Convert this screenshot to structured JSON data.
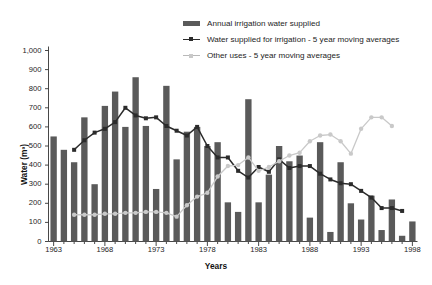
{
  "chart_data": {
    "type": "bar",
    "title": "",
    "xlabel": "Years",
    "ylabel": "Water (m³)",
    "ylim": [
      0,
      1000
    ],
    "ytick_values": [
      0,
      100,
      200,
      300,
      400,
      500,
      600,
      700,
      800,
      900,
      1000
    ],
    "ytick_labels": [
      "0",
      "100",
      "200",
      "300",
      "400",
      "500",
      "600",
      "700",
      "800",
      "900",
      "1,000"
    ],
    "xlim": [
      1963,
      1998
    ],
    "xtick_values": [
      1963,
      1968,
      1973,
      1978,
      1983,
      1988,
      1993,
      1998
    ],
    "xtick_labels": [
      "1963",
      "1968",
      "1973",
      "1978",
      "1983",
      "1988",
      "1993",
      "1998"
    ],
    "grid": false,
    "legend_position": "top-center",
    "categories": [
      1963,
      1964,
      1965,
      1966,
      1967,
      1968,
      1969,
      1970,
      1971,
      1972,
      1973,
      1974,
      1975,
      1976,
      1977,
      1978,
      1979,
      1980,
      1981,
      1982,
      1983,
      1984,
      1985,
      1986,
      1987,
      1988,
      1989,
      1990,
      1991,
      1992,
      1993,
      1994,
      1995,
      1996,
      1997,
      1998
    ],
    "series": [
      {
        "name": "Annual irrigation water supplied",
        "type": "bar",
        "color": "#5a5a5a",
        "values": [
          550,
          480,
          415,
          650,
          300,
          710,
          785,
          600,
          860,
          605,
          275,
          815,
          430,
          575,
          600,
          500,
          520,
          205,
          155,
          745,
          205,
          350,
          500,
          420,
          450,
          125,
          520,
          50,
          415,
          200,
          115,
          240,
          60,
          220,
          30,
          105
        ]
      },
      {
        "name": "Water supplied for irrigation - 5 year moving averages",
        "type": "line",
        "color": "#2b2b2b",
        "marker": "square",
        "values": [
          null,
          null,
          480,
          530,
          570,
          590,
          625,
          700,
          660,
          645,
          650,
          605,
          580,
          555,
          600,
          500,
          440,
          440,
          370,
          335,
          390,
          365,
          430,
          385,
          395,
          395,
          355,
          325,
          305,
          300,
          265,
          230,
          175,
          175,
          160,
          null
        ]
      },
      {
        "name": "Other uses - 5 year moving averages",
        "type": "line",
        "color": "#c9c9c9",
        "marker": "circle",
        "values": [
          null,
          null,
          140,
          140,
          140,
          145,
          145,
          150,
          150,
          155,
          155,
          150,
          130,
          190,
          235,
          255,
          340,
          395,
          400,
          440,
          370,
          390,
          420,
          450,
          465,
          525,
          555,
          560,
          525,
          460,
          590,
          650,
          650,
          605,
          null,
          null
        ]
      }
    ]
  }
}
